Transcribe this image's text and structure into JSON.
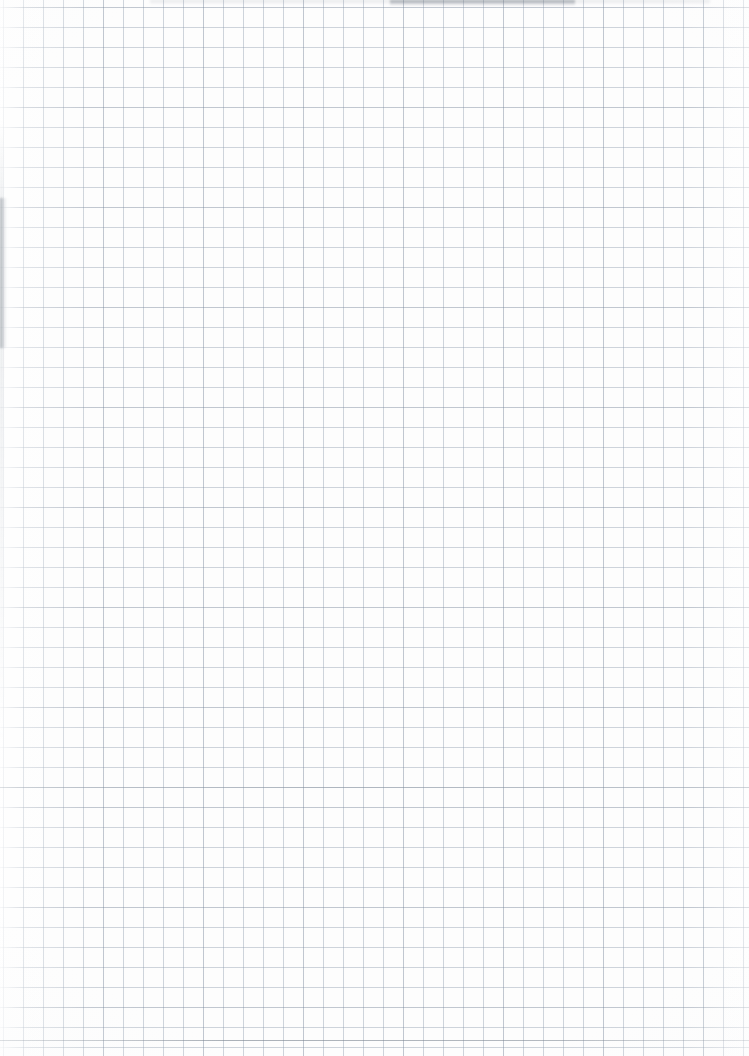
{
  "document": {
    "kind": "scanned-graph-paper",
    "description": "Blank scanned sheet of square-ruled quadrille graph paper",
    "visible_text": "",
    "page_number": "",
    "title": ""
  },
  "paper": {
    "background_color": "#fdfdfd",
    "width_px": 749,
    "height_px": 1056,
    "orientation": "portrait"
  },
  "grid": {
    "type": "square",
    "cell_size_px": 20,
    "offset_x_px": 3,
    "offset_y_px": 7,
    "line_color": "#96a3b3",
    "line_width_px": 1,
    "major_lines": false,
    "approx_columns": 38,
    "approx_rows": 53
  },
  "artifacts": {
    "top_edge_smudge": "grey scanner shadow band along the upper edge",
    "left_edge_smudge": "soft grey vertical smudge at the left margin",
    "bottom_rule": "slightly darker horizontal ruling near the lower edge",
    "vignette": "faint lightening toward the left and right edges"
  }
}
